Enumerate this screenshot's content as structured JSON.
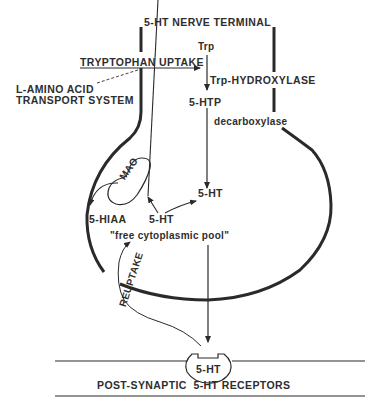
{
  "diagram": {
    "title": "5-HT NERVE TERMINAL",
    "uptake": {
      "label": "TRYPTOPHAN UPTAKE",
      "transport_line1": "L-AMINO ACID",
      "transport_line2": "TRANSPORT SYSTEM"
    },
    "pathway": {
      "precursor": "Trp",
      "enzyme1": "Trp-HYDROXYLASE",
      "intermediate": "5-HTP",
      "enzyme2": "decarboxylase",
      "product": "5-HT"
    },
    "metabolism": {
      "enzyme": "MAO",
      "metabolite": "5-HIAA",
      "pool_compound": "5-HT",
      "pool_label": "\"free cytoplasmic pool\""
    },
    "reuptake_label": "REUPTAKE",
    "synapse": {
      "receptor_ligand": "5-HT",
      "receptor_label": "POST-SYNAPTIC  5-HT RECEPTORS"
    },
    "colors": {
      "ink": "#2a2a2a",
      "background": "#ffffff"
    }
  }
}
